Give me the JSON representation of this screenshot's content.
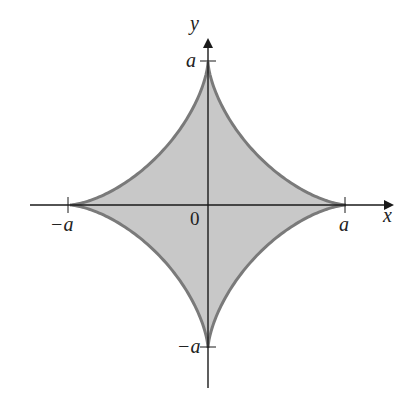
{
  "figure": {
    "type": "astroid",
    "equation_hint": "x^(2/3) + y^(2/3) = a^(2/3)",
    "colors": {
      "fill": "#c8c8c8",
      "stroke": "#7a7a7a",
      "axis": "#1a1a1a",
      "background": "#ffffff"
    }
  },
  "axes": {
    "x_label": "x",
    "y_label": "y",
    "origin_label": "0"
  },
  "ticks": {
    "x_pos": "a",
    "x_neg": "−a",
    "y_pos": "a",
    "y_neg": "−a"
  }
}
